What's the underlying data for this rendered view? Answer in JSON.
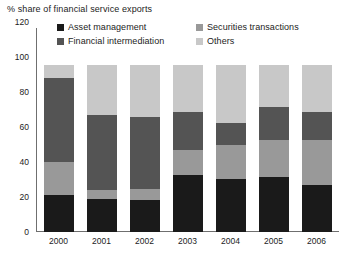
{
  "chart_data": {
    "type": "bar",
    "title": "% share of financial service exports",
    "subtitle": "",
    "xlabel": "",
    "ylabel": "",
    "stacked": true,
    "grid": false,
    "legend_position": "top",
    "ylim": [
      0,
      120
    ],
    "yticks": [
      0,
      20,
      40,
      60,
      80,
      100,
      120
    ],
    "categories": [
      "2000",
      "2001",
      "2002",
      "2003",
      "2004",
      "2005",
      "2006"
    ],
    "series": [
      {
        "name": "Asset management",
        "color": "#1a1a1a",
        "values": [
          22,
          20,
          19,
          34,
          32,
          33,
          28
        ]
      },
      {
        "name": "Securities transactions",
        "color": "#999999",
        "values": [
          20,
          5,
          7,
          15,
          20,
          22,
          27
        ]
      },
      {
        "name": "Financial intermediation",
        "color": "#545454",
        "values": [
          50,
          45,
          43,
          23,
          13,
          20,
          17
        ]
      },
      {
        "name": "Others",
        "color": "#c8c8c8",
        "values": [
          8,
          30,
          31,
          28,
          35,
          25,
          28
        ]
      }
    ],
    "stack_order": [
      "Asset management",
      "Securities transactions",
      "Financial intermediation",
      "Others"
    ],
    "legend_entries": [
      {
        "label": "Asset management",
        "color": "#1a1a1a",
        "col": 0,
        "row": 0
      },
      {
        "label": "Securities transactions",
        "color": "#999999",
        "col": 1,
        "row": 0
      },
      {
        "label": "Financial intermediation",
        "color": "#545454",
        "col": 0,
        "row": 1
      },
      {
        "label": "Others",
        "color": "#c8c8c8",
        "col": 1,
        "row": 1
      }
    ],
    "axis_color": "#6f6f6f"
  }
}
